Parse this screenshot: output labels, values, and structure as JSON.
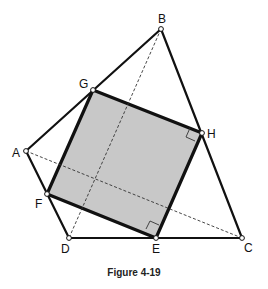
{
  "figure": {
    "caption": "Figure 4-19",
    "colors": {
      "stroke": "#111111",
      "square_fill": "#c8c8c8",
      "dash": "#333333"
    },
    "points": {
      "A": {
        "label": "A",
        "x": 26,
        "y": 151
      },
      "B": {
        "label": "B",
        "x": 161,
        "y": 29
      },
      "C": {
        "label": "C",
        "x": 242,
        "y": 238
      },
      "D": {
        "label": "D",
        "x": 69,
        "y": 238
      },
      "E": {
        "label": "E",
        "x": 156,
        "y": 238
      },
      "F": {
        "label": "F",
        "x": 47,
        "y": 194
      },
      "G": {
        "label": "G",
        "x": 93,
        "y": 90
      },
      "H": {
        "label": "H",
        "x": 202,
        "y": 133
      }
    },
    "polygon_edges": [
      "AB",
      "BC",
      "CD",
      "DA"
    ],
    "square": [
      "G",
      "H",
      "E",
      "F"
    ],
    "diagonals": [
      "AC",
      "BD"
    ],
    "right_angle_marks": [
      "H",
      "E"
    ]
  }
}
